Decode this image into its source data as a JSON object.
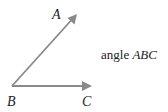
{
  "diagram": {
    "labels": {
      "a": "A",
      "b": "B",
      "c": "C"
    },
    "caption": {
      "prefix": "angle ",
      "name": "ABC"
    },
    "colors": {
      "ray": "#8a8a8a",
      "text": "#222222"
    },
    "points": {
      "B": [
        12,
        86
      ],
      "A": [
        77,
        14
      ],
      "C": [
        92,
        86
      ]
    }
  }
}
